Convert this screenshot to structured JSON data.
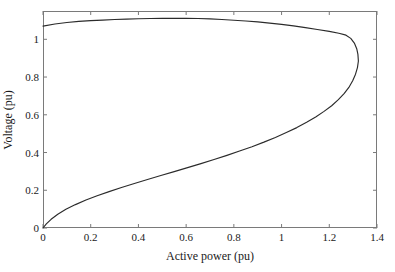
{
  "chart_data": {
    "type": "line",
    "title": "",
    "xlabel": "Active power (pu)",
    "ylabel": "Voltage (pu)",
    "xlim": [
      0,
      1.4
    ],
    "ylim": [
      0,
      1.15
    ],
    "xticks": [
      "0",
      "0.2",
      "0.4",
      "0.6",
      "0.8",
      "1",
      "1.2",
      "1.4"
    ],
    "xtick_values": [
      0,
      0.2,
      0.4,
      0.6,
      0.8,
      1.0,
      1.2,
      1.4
    ],
    "yticks": [
      "0",
      "0.2",
      "0.4",
      "0.6",
      "0.8",
      "1"
    ],
    "ytick_values": [
      0,
      0.2,
      0.4,
      0.6,
      0.8,
      1.0
    ],
    "grid": false,
    "legend": null,
    "curve_color": "#2b2b2b",
    "frame_color": "#7a7a7a",
    "background_color": "#ffffff",
    "series": [
      {
        "name": "PV nose curve",
        "comment": "Upper (stable) branch from P=0,V=1.07 through knee, then lower (unstable) branch back to origin.",
        "points": [
          [
            0.0,
            1.07
          ],
          [
            0.05,
            1.081
          ],
          [
            0.1,
            1.089
          ],
          [
            0.15,
            1.095
          ],
          [
            0.2,
            1.099
          ],
          [
            0.25,
            1.102
          ],
          [
            0.3,
            1.105
          ],
          [
            0.35,
            1.107
          ],
          [
            0.4,
            1.109
          ],
          [
            0.45,
            1.11
          ],
          [
            0.5,
            1.111
          ],
          [
            0.55,
            1.111
          ],
          [
            0.6,
            1.111
          ],
          [
            0.65,
            1.11
          ],
          [
            0.7,
            1.108
          ],
          [
            0.75,
            1.105
          ],
          [
            0.8,
            1.101
          ],
          [
            0.85,
            1.097
          ],
          [
            0.9,
            1.092
          ],
          [
            0.95,
            1.086
          ],
          [
            1.0,
            1.079
          ],
          [
            1.05,
            1.071
          ],
          [
            1.1,
            1.062
          ],
          [
            1.15,
            1.052
          ],
          [
            1.2,
            1.042
          ],
          [
            1.24,
            1.032
          ],
          [
            1.27,
            1.022
          ],
          [
            1.29,
            1.005
          ],
          [
            1.305,
            0.98
          ],
          [
            1.315,
            0.95
          ],
          [
            1.32,
            0.92
          ],
          [
            1.322,
            0.885
          ],
          [
            1.318,
            0.85
          ],
          [
            1.31,
            0.815
          ],
          [
            1.298,
            0.78
          ],
          [
            1.282,
            0.745
          ],
          [
            1.262,
            0.712
          ],
          [
            1.238,
            0.68
          ],
          [
            1.21,
            0.648
          ],
          [
            1.178,
            0.618
          ],
          [
            1.143,
            0.588
          ],
          [
            1.105,
            0.56
          ],
          [
            1.064,
            0.532
          ],
          [
            1.02,
            0.506
          ],
          [
            0.974,
            0.48
          ],
          [
            0.926,
            0.455
          ],
          [
            0.876,
            0.431
          ],
          [
            0.824,
            0.408
          ],
          [
            0.771,
            0.385
          ],
          [
            0.717,
            0.363
          ],
          [
            0.662,
            0.341
          ],
          [
            0.606,
            0.32
          ],
          [
            0.55,
            0.299
          ],
          [
            0.494,
            0.278
          ],
          [
            0.438,
            0.257
          ],
          [
            0.383,
            0.236
          ],
          [
            0.329,
            0.215
          ],
          [
            0.277,
            0.193
          ],
          [
            0.227,
            0.171
          ],
          [
            0.18,
            0.148
          ],
          [
            0.136,
            0.124
          ],
          [
            0.096,
            0.099
          ],
          [
            0.062,
            0.073
          ],
          [
            0.034,
            0.046
          ],
          [
            0.014,
            0.022
          ],
          [
            0.0,
            0.0
          ]
        ]
      }
    ]
  }
}
